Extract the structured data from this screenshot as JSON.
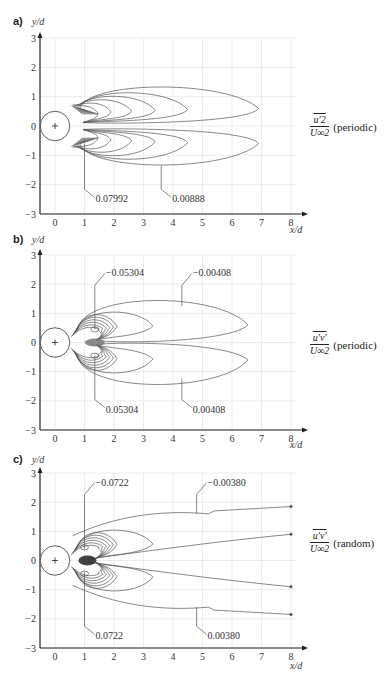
{
  "panels": [
    {
      "letter": "a)",
      "y_axis_title": "y/d",
      "x_axis_title": "x/d",
      "quantity_numerator": "u'2",
      "quantity_denominator": "U∞2",
      "quantity_kind": "(periodic)",
      "labels": [
        "0.07992",
        "0.00888"
      ]
    },
    {
      "letter": "b)",
      "y_axis_title": "y/d",
      "x_axis_title": "x/d",
      "quantity_numerator": "u'v'",
      "quantity_denominator": "U∞2",
      "quantity_kind": "(periodic)",
      "labels": [
        "−0.05304",
        "−0.00408",
        "0.05304",
        "0.00408"
      ]
    },
    {
      "letter": "c)",
      "y_axis_title": "y/d",
      "x_axis_title": "x/d",
      "quantity_numerator": "u'v'",
      "quantity_denominator": "U∞2",
      "quantity_kind": "(random)",
      "labels": [
        "−0.0722",
        "−0.00380",
        "0.0722",
        "0.00380"
      ]
    }
  ],
  "chart_data": [
    {
      "type": "contour",
      "title": "a) normalized periodic streamwise Reynolds stress u'^2/U∞^2",
      "xlabel": "x/d",
      "ylabel": "y/d",
      "xlim": [
        -0.5,
        8.3
      ],
      "ylim": [
        -3,
        3
      ],
      "x_ticks": [
        0,
        1,
        2,
        3,
        4,
        5,
        6,
        7,
        8
      ],
      "y_ticks": [
        -3,
        -2,
        -1,
        0,
        1,
        2,
        3
      ],
      "grid": true,
      "cylinder": {
        "center": [
          0,
          0
        ],
        "diameter": 1
      },
      "contour_labels": [
        {
          "value": 0.07992,
          "text": "0.07992",
          "label_pos": [
            1.6,
            -2.5
          ],
          "points_to": [
            1.0,
            -0.6
          ]
        },
        {
          "value": 0.00888,
          "text": "0.00888",
          "label_pos": [
            4.4,
            -2.5
          ],
          "points_to": [
            3.6,
            -1.35
          ]
        }
      ],
      "symmetry": "two lobes symmetric about y/d = 0",
      "outer_contour_extent_x": 6.9,
      "outer_contour_extent_y": 1.45
    },
    {
      "type": "contour",
      "title": "b) normalized periodic Reynolds shear stress u'v'/U∞^2",
      "xlabel": "x/d",
      "ylabel": "y/d",
      "xlim": [
        -0.5,
        8.3
      ],
      "ylim": [
        -3,
        3
      ],
      "x_ticks": [
        0,
        1,
        2,
        3,
        4,
        5,
        6,
        7,
        8
      ],
      "y_ticks": [
        -3,
        -2,
        -1,
        0,
        1,
        2,
        3
      ],
      "grid": true,
      "cylinder": {
        "center": [
          0,
          0
        ],
        "diameter": 1
      },
      "contour_labels": [
        {
          "value": -0.05304,
          "text": "−0.05304",
          "label_pos": [
            2.0,
            2.3
          ],
          "points_to": [
            1.35,
            0.45
          ]
        },
        {
          "value": -0.00408,
          "text": "−0.00408",
          "label_pos": [
            4.7,
            2.3
          ],
          "points_to": [
            4.3,
            1.25
          ]
        },
        {
          "value": 0.05304,
          "text": "0.05304",
          "label_pos": [
            2.0,
            -2.3
          ],
          "points_to": [
            1.35,
            -0.45
          ]
        },
        {
          "value": 0.00408,
          "text": "0.00408",
          "label_pos": [
            4.7,
            -2.3
          ],
          "points_to": [
            4.3,
            -1.25
          ]
        }
      ],
      "outer_contour_extent_x": 6.8,
      "outer_contour_extent_y": 1.3
    },
    {
      "type": "contour",
      "title": "c) normalized random Reynolds shear stress u'v'/U∞^2",
      "xlabel": "x/d",
      "ylabel": "y/d",
      "xlim": [
        -0.5,
        8.3
      ],
      "ylim": [
        -3,
        3
      ],
      "x_ticks": [
        0,
        1,
        2,
        3,
        4,
        5,
        6,
        7,
        8
      ],
      "y_ticks": [
        -3,
        -2,
        -1,
        0,
        1,
        2,
        3
      ],
      "grid": true,
      "cylinder": {
        "center": [
          0,
          0
        ],
        "diameter": 1
      },
      "contour_labels": [
        {
          "value": -0.0722,
          "text": "−0.0722",
          "label_pos": [
            1.8,
            2.6
          ],
          "points_to": [
            1.0,
            0.4
          ]
        },
        {
          "value": -0.0038,
          "text": "−0.00380",
          "label_pos": [
            5.4,
            2.6
          ],
          "points_to": [
            4.8,
            1.6
          ]
        },
        {
          "value": 0.0722,
          "text": "0.0722",
          "label_pos": [
            1.8,
            -2.6
          ],
          "points_to": [
            1.0,
            -0.4
          ]
        },
        {
          "value": 0.0038,
          "text": "0.00380",
          "label_pos": [
            5.4,
            -2.6
          ],
          "points_to": [
            4.8,
            -1.6
          ]
        }
      ],
      "outer_contour_extent_x": 8.0,
      "outer_contour_extent_y": 1.85
    }
  ]
}
